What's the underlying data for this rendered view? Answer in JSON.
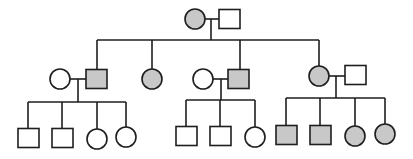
{
  "diagram": {
    "type": "pedigree",
    "colors": {
      "affected": "#c8c8c8",
      "unaffected": "#ffffff",
      "stroke": "#1e1e1e"
    },
    "individuals": [
      {
        "id": "I-1",
        "sex": "female",
        "affected": true,
        "cx": 195,
        "cy": 19
      },
      {
        "id": "I-2",
        "sex": "male",
        "affected": false,
        "cx": 229,
        "cy": 19
      },
      {
        "id": "II-1",
        "sex": "female",
        "affected": false,
        "cx": 60,
        "cy": 79
      },
      {
        "id": "II-2",
        "sex": "male",
        "affected": true,
        "cx": 96,
        "cy": 79
      },
      {
        "id": "II-3",
        "sex": "female",
        "affected": true,
        "cx": 152,
        "cy": 79
      },
      {
        "id": "II-4",
        "sex": "female",
        "affected": false,
        "cx": 203,
        "cy": 79
      },
      {
        "id": "II-5",
        "sex": "male",
        "affected": true,
        "cx": 238,
        "cy": 79
      },
      {
        "id": "II-6",
        "sex": "female",
        "affected": true,
        "cx": 319,
        "cy": 76
      },
      {
        "id": "II-7",
        "sex": "male",
        "affected": false,
        "cx": 355,
        "cy": 75
      },
      {
        "id": "III-1",
        "sex": "male",
        "affected": false,
        "cx": 28,
        "cy": 138
      },
      {
        "id": "III-2",
        "sex": "male",
        "affected": false,
        "cx": 62,
        "cy": 138
      },
      {
        "id": "III-3",
        "sex": "female",
        "affected": false,
        "cx": 97,
        "cy": 139
      },
      {
        "id": "III-4",
        "sex": "female",
        "affected": false,
        "cx": 126,
        "cy": 137
      },
      {
        "id": "III-5",
        "sex": "male",
        "affected": false,
        "cx": 186,
        "cy": 136
      },
      {
        "id": "III-6",
        "sex": "male",
        "affected": false,
        "cx": 220,
        "cy": 136
      },
      {
        "id": "III-7",
        "sex": "female",
        "affected": false,
        "cx": 255,
        "cy": 137
      },
      {
        "id": "III-8",
        "sex": "male",
        "affected": true,
        "cx": 286,
        "cy": 135
      },
      {
        "id": "III-9",
        "sex": "male",
        "affected": true,
        "cx": 320,
        "cy": 135
      },
      {
        "id": "III-10",
        "sex": "female",
        "affected": true,
        "cx": 355,
        "cy": 136
      },
      {
        "id": "III-11",
        "sex": "female",
        "affected": true,
        "cx": 385,
        "cy": 134
      }
    ],
    "lines": [
      [
        205,
        19,
        219,
        19
      ],
      [
        211,
        19,
        211,
        40
      ],
      [
        97,
        40,
        319,
        40
      ],
      [
        97,
        40,
        97,
        69
      ],
      [
        152,
        40,
        152,
        69
      ],
      [
        240,
        40,
        240,
        69
      ],
      [
        319,
        40,
        319,
        66
      ],
      [
        70,
        79,
        86,
        79
      ],
      [
        78,
        79,
        78,
        102
      ],
      [
        28,
        102,
        126,
        102
      ],
      [
        28,
        102,
        28,
        129
      ],
      [
        62,
        102,
        62,
        129
      ],
      [
        97,
        102,
        97,
        129
      ],
      [
        126,
        102,
        126,
        127
      ],
      [
        213,
        79,
        228,
        79
      ],
      [
        221,
        79,
        221,
        100
      ],
      [
        186,
        100,
        255,
        100
      ],
      [
        186,
        100,
        186,
        127
      ],
      [
        220,
        100,
        220,
        127
      ],
      [
        255,
        100,
        255,
        127
      ],
      [
        329,
        76,
        345,
        76
      ],
      [
        336,
        76,
        336,
        98
      ],
      [
        286,
        98,
        385,
        98
      ],
      [
        286,
        98,
        286,
        126
      ],
      [
        320,
        98,
        320,
        126
      ],
      [
        355,
        98,
        355,
        126
      ],
      [
        385,
        98,
        385,
        124
      ]
    ],
    "symbol_size": {
      "square": 20,
      "circle_r": 10
    }
  }
}
